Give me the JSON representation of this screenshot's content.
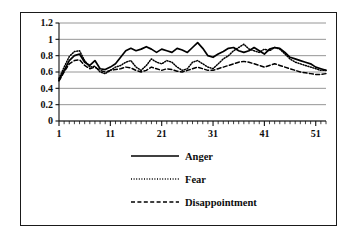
{
  "chart_data": {
    "type": "line",
    "title": "",
    "xlabel": "",
    "ylabel": "",
    "xlim": [
      1,
      53
    ],
    "ylim": [
      0,
      1.2
    ],
    "grid": true,
    "gridlines_y": [
      0,
      0.2,
      0.4,
      0.6,
      0.8,
      1,
      1.2
    ],
    "legend_position": "bottom",
    "y_ticks": [
      "1.2",
      "1",
      "0.8",
      "0.6",
      "0.4",
      "0.2",
      "0"
    ],
    "y_tick_values": [
      1.2,
      1,
      0.8,
      0.6,
      0.4,
      0.2,
      0
    ],
    "x_ticks": [
      "1",
      "11",
      "21",
      "31",
      "41",
      "51"
    ],
    "x_tick_values": [
      1,
      11,
      21,
      31,
      41,
      51
    ],
    "x": [
      1,
      2,
      3,
      4,
      5,
      6,
      7,
      8,
      9,
      10,
      11,
      12,
      13,
      14,
      15,
      16,
      17,
      18,
      19,
      20,
      21,
      22,
      23,
      24,
      25,
      26,
      27,
      28,
      29,
      30,
      31,
      32,
      33,
      34,
      35,
      36,
      37,
      38,
      39,
      40,
      41,
      42,
      43,
      44,
      45,
      46,
      47,
      48,
      49,
      50,
      51,
      52,
      53
    ],
    "series": [
      {
        "name": "Anger",
        "style": "solid",
        "color": "#000000",
        "values": [
          0.5,
          0.62,
          0.74,
          0.8,
          0.82,
          0.72,
          0.68,
          0.74,
          0.64,
          0.63,
          0.66,
          0.7,
          0.78,
          0.86,
          0.89,
          0.86,
          0.88,
          0.91,
          0.88,
          0.84,
          0.88,
          0.86,
          0.84,
          0.89,
          0.87,
          0.84,
          0.9,
          0.96,
          0.89,
          0.8,
          0.78,
          0.82,
          0.85,
          0.89,
          0.9,
          0.86,
          0.84,
          0.86,
          0.9,
          0.86,
          0.82,
          0.88,
          0.9,
          0.89,
          0.84,
          0.78,
          0.76,
          0.74,
          0.72,
          0.7,
          0.66,
          0.64,
          0.62
        ]
      },
      {
        "name": "Fear",
        "style": "dotted",
        "color": "#000000",
        "values": [
          0.52,
          0.66,
          0.79,
          0.85,
          0.86,
          0.74,
          0.66,
          0.67,
          0.6,
          0.58,
          0.62,
          0.66,
          0.68,
          0.72,
          0.74,
          0.66,
          0.62,
          0.68,
          0.76,
          0.72,
          0.7,
          0.74,
          0.72,
          0.66,
          0.62,
          0.64,
          0.72,
          0.74,
          0.7,
          0.66,
          0.64,
          0.7,
          0.76,
          0.8,
          0.86,
          0.9,
          0.94,
          0.88,
          0.86,
          0.84,
          0.88,
          0.86,
          0.9,
          0.88,
          0.82,
          0.76,
          0.72,
          0.7,
          0.68,
          0.66,
          0.64,
          0.62,
          0.62
        ]
      },
      {
        "name": "Disappointment",
        "style": "dashed",
        "color": "#000000",
        "values": [
          0.49,
          0.6,
          0.7,
          0.74,
          0.75,
          0.68,
          0.64,
          0.66,
          0.62,
          0.6,
          0.62,
          0.63,
          0.64,
          0.66,
          0.65,
          0.62,
          0.6,
          0.62,
          0.66,
          0.64,
          0.62,
          0.64,
          0.63,
          0.61,
          0.6,
          0.62,
          0.64,
          0.66,
          0.64,
          0.62,
          0.62,
          0.64,
          0.66,
          0.68,
          0.7,
          0.72,
          0.73,
          0.72,
          0.7,
          0.68,
          0.66,
          0.68,
          0.7,
          0.68,
          0.66,
          0.64,
          0.62,
          0.6,
          0.59,
          0.58,
          0.57,
          0.57,
          0.58
        ]
      }
    ]
  },
  "legend": {
    "items": [
      {
        "label": "Anger",
        "style": "solid"
      },
      {
        "label": "Fear",
        "style": "dotted"
      },
      {
        "label": "Disappointment",
        "style": "dashed"
      }
    ]
  }
}
